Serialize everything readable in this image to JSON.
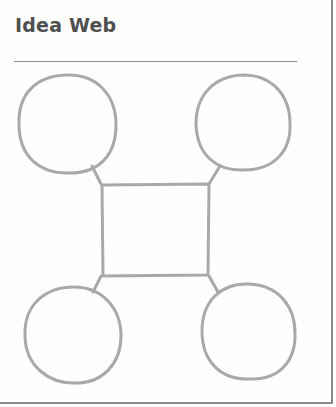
{
  "worksheet": {
    "title": "Idea Web",
    "stroke_color": "#a8a8a8",
    "title_color": "#4f4f4f",
    "rule_color": "#8c8c8c"
  },
  "idea_web": {
    "center": {
      "shape": "square",
      "text": ""
    },
    "outer_nodes": [
      {
        "position": "top-left",
        "shape": "circle",
        "text": ""
      },
      {
        "position": "top-right",
        "shape": "circle",
        "text": ""
      },
      {
        "position": "bottom-left",
        "shape": "circle",
        "text": ""
      },
      {
        "position": "bottom-right",
        "shape": "circle",
        "text": ""
      }
    ]
  }
}
